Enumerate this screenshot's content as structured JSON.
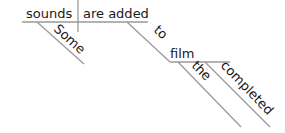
{
  "diagram": {
    "type": "sentence-diagram",
    "sentence_words": {
      "subject": "sounds",
      "predicate": "are added",
      "subject_modifier": "Some",
      "preposition": "to",
      "prep_object": "film",
      "object_modifier_1": "the",
      "object_modifier_2": "completed"
    },
    "colors": {
      "text": "#1a1a1a",
      "line": "#9a9a9a",
      "background": "#ffffff"
    }
  }
}
